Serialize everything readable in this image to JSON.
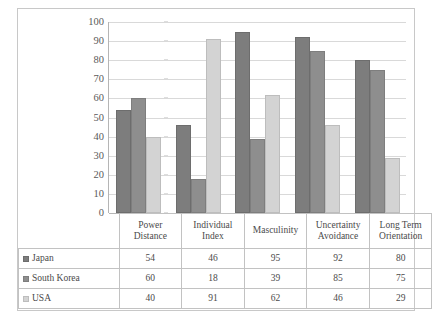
{
  "chart_data": {
    "type": "bar",
    "title": "",
    "xlabel": "",
    "ylabel": "",
    "ylim": [
      0,
      100
    ],
    "y_ticks": [
      0,
      10,
      20,
      30,
      40,
      50,
      60,
      70,
      80,
      90,
      100
    ],
    "grid": true,
    "legend_position": "table-below",
    "categories": [
      "Power Distance",
      "Individual Index",
      "Masculinity",
      "Uncertainty Avoidance",
      "Long Term Orientation"
    ],
    "category_lines": [
      [
        "Power",
        "Distance"
      ],
      [
        "Individual",
        "Index"
      ],
      [
        "Masculinity",
        ""
      ],
      [
        "Uncertainty",
        "Avoidance"
      ],
      [
        "Long Term",
        "Orientation"
      ]
    ],
    "series": [
      {
        "name": "Japan",
        "color": "#7d7d7d",
        "values": [
          54,
          46,
          95,
          92,
          80
        ]
      },
      {
        "name": "South Korea",
        "color": "#8e8e8e",
        "values": [
          60,
          18,
          39,
          85,
          75
        ]
      },
      {
        "name": "USA",
        "color": "#d3d3d3",
        "values": [
          40,
          91,
          62,
          46,
          29
        ]
      }
    ]
  },
  "colors": {
    "japan": "#7d7d7d",
    "south_korea": "#8e8e8e",
    "usa": "#d3d3d3",
    "gridline": "#d9d9d9",
    "axis": "#b5b5b5",
    "border": "#c8c8c8",
    "text": "#4a4a4a"
  }
}
